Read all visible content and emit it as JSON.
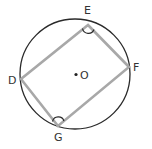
{
  "diagram": {
    "type": "inscribed-quadrilateral",
    "circle": {
      "cx": 75,
      "cy": 74,
      "r": 55,
      "stroke": "#2a2a2a"
    },
    "quad_stroke": "#a8a8a8",
    "points": {
      "E": {
        "x": 88,
        "y": 25
      },
      "F": {
        "x": 129,
        "y": 67
      },
      "G": {
        "x": 58,
        "y": 126
      },
      "D": {
        "x": 21,
        "y": 79
      }
    },
    "labels": {
      "E": "E",
      "F": "F",
      "G": "G",
      "D": "D",
      "center": "O"
    },
    "angle_marks": [
      "E",
      "G"
    ]
  }
}
